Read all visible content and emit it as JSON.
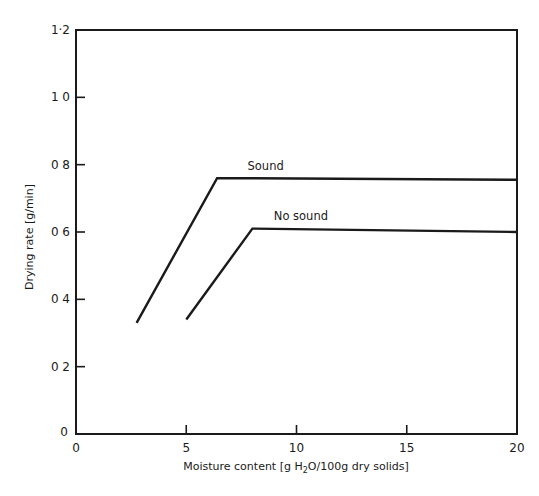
{
  "chart_data": {
    "type": "line",
    "title": "",
    "xlabel": "Moisture content [g H2O/100g dry solids]",
    "xlabel_parts": {
      "pre": "Moisture content  [g H",
      "sub": "2",
      "post": "O/100g dry solids]"
    },
    "ylabel": "Drying rate [g/min]",
    "xlim": [
      0,
      20
    ],
    "ylim": [
      0,
      1.2
    ],
    "x_ticks": [
      0,
      5,
      10,
      15,
      20
    ],
    "x_tick_labels": [
      "0",
      "5",
      "10",
      "15",
      "20"
    ],
    "y_ticks": [
      0,
      0.2,
      0.4,
      0.6,
      0.8,
      1.0,
      1.2
    ],
    "y_tick_labels": [
      "0",
      "0 2",
      "0 4",
      "0 6",
      "0 8",
      "1 0",
      "1·2"
    ],
    "grid": false,
    "legend": "inline labels above each curve",
    "series": [
      {
        "name": "Sound",
        "x": [
          2.75,
          6.4,
          20
        ],
        "y": [
          0.33,
          0.76,
          0.755
        ],
        "label_at": [
          8.6,
          0.785
        ]
      },
      {
        "name": "No sound",
        "x": [
          5.0,
          8.0,
          20
        ],
        "y": [
          0.34,
          0.61,
          0.6
        ],
        "label_at": [
          10.2,
          0.635
        ]
      }
    ]
  }
}
